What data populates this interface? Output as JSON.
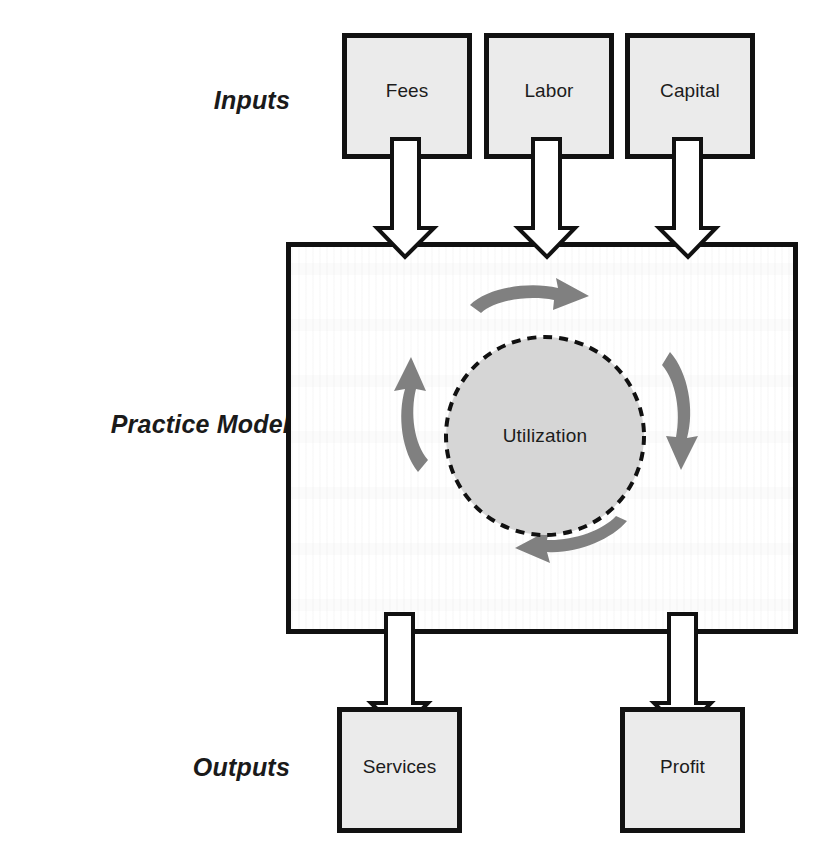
{
  "diagram": {
    "title": "Practice Model",
    "sections": {
      "inputs_label": "Inputs",
      "practice_label": "Practice Model",
      "outputs_label": "Outputs"
    },
    "inputs": [
      {
        "id": "fees",
        "label": "Fees"
      },
      {
        "id": "labor",
        "label": "Labor"
      },
      {
        "id": "capital",
        "label": "Capital"
      }
    ],
    "core": {
      "circle_label": "Utilization",
      "cycle_arrow_count": 4,
      "cycle_direction": "clockwise",
      "circle_border_style": "dashed"
    },
    "outputs": [
      {
        "id": "services",
        "label": "Services"
      },
      {
        "id": "profit",
        "label": "Profit"
      }
    ],
    "flow_arrows": {
      "input_arrow_count": 3,
      "output_arrow_count": 2,
      "style": "hollow-white-outlined"
    },
    "colors": {
      "box_fill": "#ebebeb",
      "box_stroke": "#111111",
      "cycle_arrow_fill": "#808080",
      "circle_fill": "#d6d6d6",
      "circle_stroke": "#111111",
      "flow_arrow_fill": "#ffffff",
      "flow_arrow_stroke": "#111111",
      "text": "#1c1c1c",
      "background": "#ffffff"
    }
  }
}
